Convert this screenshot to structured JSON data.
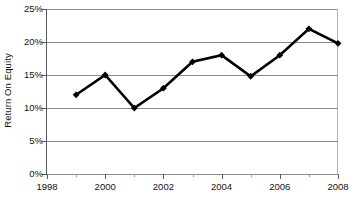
{
  "chart_data": {
    "type": "line",
    "title": "",
    "xlabel": "",
    "ylabel": "Return On Equity",
    "x": [
      1999,
      2000,
      2001,
      2002,
      2003,
      2004,
      2005,
      2006,
      2007,
      2008
    ],
    "values": [
      12.0,
      15.0,
      10.0,
      13.0,
      17.0,
      18.0,
      14.8,
      18.0,
      22.0,
      19.8
    ],
    "series": [
      {
        "name": "Return On Equity",
        "values": [
          12.0,
          15.0,
          10.0,
          13.0,
          17.0,
          18.0,
          14.8,
          18.0,
          22.0,
          19.8
        ]
      }
    ],
    "xlim": [
      1998,
      2008
    ],
    "ylim": [
      0,
      25
    ],
    "x_tick_labels": [
      "1998",
      "2000",
      "2002",
      "2004",
      "2006",
      "2008"
    ],
    "x_tick_values": [
      1998,
      2000,
      2002,
      2004,
      2006,
      2008
    ],
    "x_minor_tick_values": [
      1999,
      2001,
      2003,
      2005,
      2007
    ],
    "y_tick_labels": [
      "0%",
      "5%",
      "10%",
      "15%",
      "20%",
      "25%"
    ],
    "y_tick_values": [
      0,
      5,
      10,
      15,
      20,
      25
    ],
    "grid": true,
    "grid_axis": "y",
    "legend": false,
    "legend_position": "none",
    "marker": "diamond",
    "line_color": "#000000",
    "marker_color": "#000000",
    "grid_color": "#8c8c8c",
    "axis_color": "#5a5a5a",
    "background_color": "#ffffff",
    "annotations": []
  },
  "axis": {
    "y_title": "Return On Equity"
  }
}
